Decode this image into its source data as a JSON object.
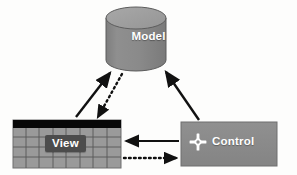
{
  "diagram": {
    "background_color": "#fdfdfc",
    "nodes": {
      "model": {
        "label": "Model",
        "shape": "cylinder",
        "fill_color": "#8a8a8a",
        "top_fill_color": "#9e9e9e",
        "text_color": "#ffffff",
        "x": 106,
        "y": 8,
        "width": 60,
        "height": 64
      },
      "view": {
        "label": "View",
        "shape": "table-grid",
        "fill_color": "#9a9a9a",
        "header_color": "#080808",
        "grid_line_color": "#4a4a4a",
        "chip_color": "#4c4c4c",
        "text_color": "#ffffff",
        "x": 13,
        "y": 120,
        "width": 108,
        "height": 48,
        "columns": 8,
        "rows": 4
      },
      "control": {
        "label": "Control",
        "shape": "rectangle",
        "fill_color": "#8c8c8c",
        "text_color": "#ffffff",
        "icon": "move-cross-icon",
        "icon_color": "#ffffff",
        "x": 181,
        "y": 122,
        "width": 96,
        "height": 44
      }
    },
    "edges": [
      {
        "name": "view-to-model",
        "from": "view",
        "to": "model",
        "style": "solid",
        "color": "#111111",
        "arrowhead": "end",
        "direction": "up-right"
      },
      {
        "name": "model-to-view",
        "from": "model",
        "to": "view",
        "style": "dotted",
        "color": "#111111",
        "arrowhead": "end",
        "direction": "down-left"
      },
      {
        "name": "control-to-model",
        "from": "control",
        "to": "model",
        "style": "solid",
        "color": "#111111",
        "arrowhead": "end",
        "direction": "up-left"
      },
      {
        "name": "control-to-view",
        "from": "control",
        "to": "view",
        "style": "solid",
        "color": "#111111",
        "arrowhead": "end",
        "direction": "left"
      },
      {
        "name": "view-to-control",
        "from": "view",
        "to": "control",
        "style": "dotted",
        "color": "#111111",
        "arrowhead": "end",
        "direction": "right"
      }
    ]
  }
}
